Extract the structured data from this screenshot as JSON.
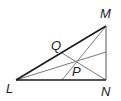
{
  "diagram": {
    "type": "triangle-geometry",
    "vertices": {
      "L": {
        "label": "L",
        "x": 16,
        "y": 80
      },
      "M": {
        "label": "M",
        "x": 106,
        "y": 26
      },
      "N": {
        "label": "N",
        "x": 106,
        "y": 80
      }
    },
    "points": {
      "Q": {
        "label": "Q",
        "x": 62,
        "y": 53
      },
      "P": {
        "label": "P",
        "x": 77,
        "y": 61
      }
    },
    "colors": {
      "triangle": "#1a1a1a",
      "cevians": "#7a7a7a",
      "labels": "#222222"
    }
  }
}
